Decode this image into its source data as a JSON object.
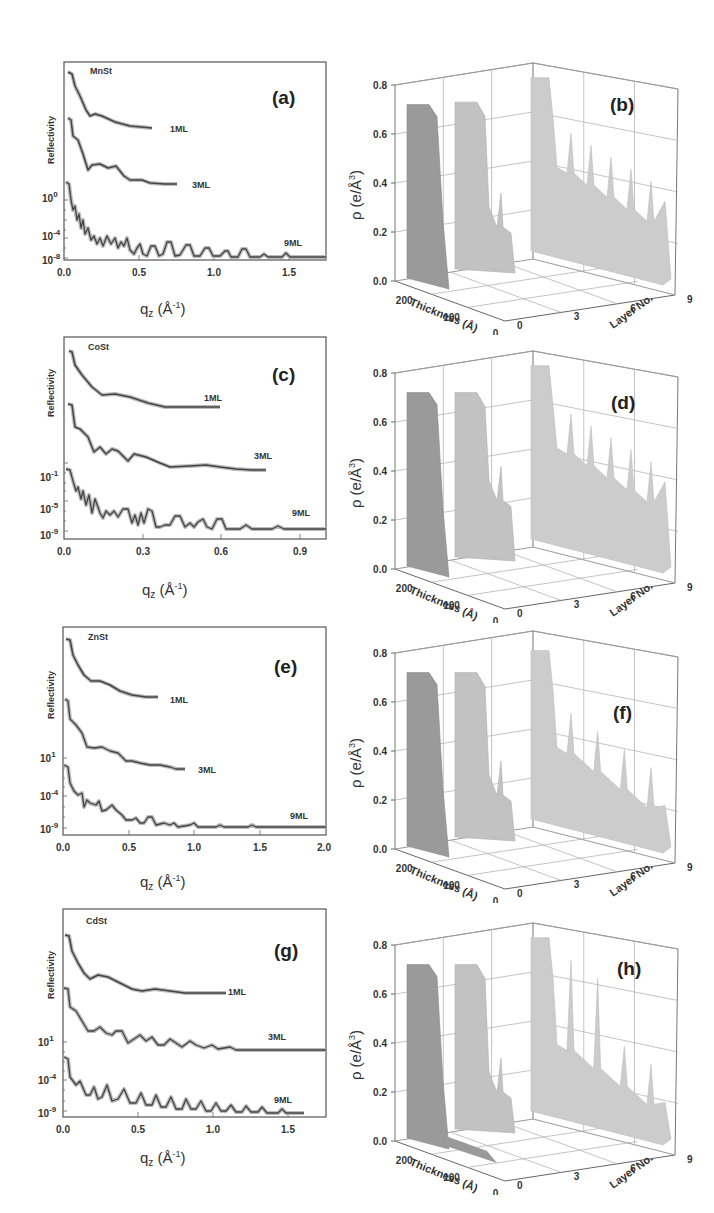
{
  "figure": {
    "left_column": "X-ray reflectivity curves (log scale) with fits for 1ML, 3ML, 9ML films",
    "right_column": "3D electron density profiles vs thickness and layer number"
  },
  "chart_data": [
    {
      "id": "a",
      "type": "line",
      "panel_label": "(a)",
      "material": "MnSt",
      "ylabel": "Reflectivity",
      "xlabel": "q_z (Å⁻¹)",
      "xlim": [
        0.0,
        1.75
      ],
      "xticks": [
        "0.0",
        "0.5",
        "1.0",
        "1.5"
      ],
      "yticks": [
        "10^0",
        "10^-4",
        "10^-8"
      ],
      "series": [
        {
          "name": "1ML",
          "x_end": 0.6
        },
        {
          "name": "3ML",
          "x_end": 0.9
        },
        {
          "name": "9ML",
          "x_end": 1.75
        }
      ]
    },
    {
      "id": "b",
      "type": "area3d",
      "panel_label": "(b)",
      "zlabel": "ρ (e/Å³)",
      "xlabel": "Thickness (Å)",
      "ylabel": "Layer No.",
      "zticks": [
        "0.0",
        "0.2",
        "0.4",
        "0.6",
        "0.8"
      ],
      "xticks": [
        "200",
        "100",
        "0"
      ],
      "yticks": [
        "0",
        "3",
        "6",
        "9"
      ],
      "series": [
        {
          "name": "1ML",
          "plateau": 0.72
        },
        {
          "name": "3ML",
          "plateau": 0.73,
          "tail": 0.22,
          "spikes": 1
        },
        {
          "name": "9ML",
          "plateau": 0.74,
          "tail": 0.35,
          "spikes": 5
        }
      ]
    },
    {
      "id": "c",
      "type": "line",
      "panel_label": "(c)",
      "material": "CoSt",
      "ylabel": "Reflectivity",
      "xlabel": "q_z (Å⁻¹)",
      "xlim": [
        0.0,
        1.0
      ],
      "xticks": [
        "0.0",
        "0.3",
        "0.6",
        "0.9"
      ],
      "yticks": [
        "10^-1",
        "10^-5",
        "10^-9"
      ],
      "series": [
        {
          "name": "1ML",
          "x_end": 0.66
        },
        {
          "name": "3ML",
          "x_end": 0.91
        },
        {
          "name": "9ML",
          "x_end": 1.0
        }
      ]
    },
    {
      "id": "d",
      "type": "area3d",
      "panel_label": "(d)",
      "zlabel": "ρ (e/Å³)",
      "xlabel": "Thickness (Å)",
      "ylabel": "Layer No.",
      "zticks": [
        "0.0",
        "0.2",
        "0.4",
        "0.6",
        "0.8"
      ],
      "xticks": [
        "200",
        "100",
        "0"
      ],
      "yticks": [
        "0",
        "3",
        "6",
        "9"
      ],
      "series": [
        {
          "name": "1ML",
          "plateau": 0.72
        },
        {
          "name": "3ML",
          "plateau": 0.72,
          "tail": 0.28,
          "spikes": 1
        },
        {
          "name": "9ML",
          "plateau": 0.74,
          "tail": 0.38,
          "spikes": 5
        }
      ]
    },
    {
      "id": "e",
      "type": "line",
      "panel_label": "(e)",
      "material": "ZnSt",
      "ylabel": "Reflectivity",
      "xlabel": "q_z (Å⁻¹)",
      "xlim": [
        0.0,
        2.0
      ],
      "xticks": [
        "0.0",
        "0.5",
        "1.0",
        "1.5",
        "2.0"
      ],
      "yticks": [
        "10^1",
        "10^-4",
        "10^-9"
      ],
      "series": [
        {
          "name": "1ML",
          "x_end": 0.72
        },
        {
          "name": "3ML",
          "x_end": 1.0
        },
        {
          "name": "9ML",
          "x_end": 2.0
        }
      ]
    },
    {
      "id": "f",
      "type": "area3d",
      "panel_label": "(f)",
      "zlabel": "ρ (e/Å³)",
      "xlabel": "Thickness (Å)",
      "ylabel": "Layer No.",
      "zticks": [
        "0.0",
        "0.2",
        "0.4",
        "0.6",
        "0.8"
      ],
      "xticks": [
        "200",
        "100",
        "0"
      ],
      "yticks": [
        "0",
        "3",
        "6",
        "9"
      ],
      "series": [
        {
          "name": "1ML",
          "plateau": 0.72
        },
        {
          "name": "3ML",
          "plateau": 0.72,
          "tail": 0.22,
          "spikes": 1
        },
        {
          "name": "9ML",
          "plateau": 0.72,
          "tail": 0.3,
          "spikes": 4
        }
      ]
    },
    {
      "id": "g",
      "type": "line",
      "panel_label": "(g)",
      "material": "CdSt",
      "ylabel": "Reflectivity",
      "xlabel": "q_z (Å⁻¹)",
      "xlim": [
        0.0,
        1.75
      ],
      "xticks": [
        "0.0",
        "0.5",
        "1.0",
        "1.5"
      ],
      "yticks": [
        "10^1",
        "10^-4",
        "10^-9"
      ],
      "series": [
        {
          "name": "1ML",
          "x_end": 1.08
        },
        {
          "name": "3ML",
          "x_end": 1.75
        },
        {
          "name": "9ML",
          "x_end": 1.7
        }
      ]
    },
    {
      "id": "h",
      "type": "area3d",
      "panel_label": "(h)",
      "zlabel": "ρ (e/Å³)",
      "xlabel": "Thickness (Å)",
      "ylabel": "Layer No.",
      "zticks": [
        "0.0",
        "0.2",
        "0.4",
        "0.6",
        "0.8"
      ],
      "xticks": [
        "200",
        "100",
        "0"
      ],
      "yticks": [
        "0",
        "3",
        "6",
        "9"
      ],
      "series": [
        {
          "name": "1ML",
          "plateau": 0.72
        },
        {
          "name": "3ML",
          "plateau": 0.72,
          "tail": 0.2,
          "spikes": 1
        },
        {
          "name": "9ML",
          "plateau": 0.74,
          "tail": 0.28,
          "spikes": 4
        }
      ]
    }
  ],
  "labels": {
    "reflectivity": "Reflectivity",
    "qz": "q",
    "qz_sub": "z",
    "qz_unit": "(Å",
    "qz_exp": "-1",
    "qz_close": ")",
    "rho": "ρ (e/Å",
    "rho_exp": "3",
    "rho_close": ")",
    "thickness": "Thickness (Å)",
    "layer_no": "Layer No.",
    "ml1": "1ML",
    "ml3": "3ML",
    "ml9": "9ML"
  },
  "panels_left": [
    {
      "label": "(a)",
      "material": "MnSt",
      "x_ticks": [
        "0.0",
        "0.5",
        "1.0",
        "1.5"
      ],
      "y_ticks": [
        {
          "base": "10",
          "exp": "0"
        },
        {
          "base": "10",
          "exp": "-4"
        },
        {
          "base": "10",
          "exp": "-8"
        }
      ]
    },
    {
      "label": "(c)",
      "material": "CoSt",
      "x_ticks": [
        "0.0",
        "0.3",
        "0.6",
        "0.9"
      ],
      "y_ticks": [
        {
          "base": "10",
          "exp": "-1"
        },
        {
          "base": "10",
          "exp": "-5"
        },
        {
          "base": "10",
          "exp": "-9"
        }
      ]
    },
    {
      "label": "(e)",
      "material": "ZnSt",
      "x_ticks": [
        "0.0",
        "0.5",
        "1.0",
        "1.5",
        "2.0"
      ],
      "y_ticks": [
        {
          "base": "10",
          "exp": "1"
        },
        {
          "base": "10",
          "exp": "-4"
        },
        {
          "base": "10",
          "exp": "-9"
        }
      ]
    },
    {
      "label": "(g)",
      "material": "CdSt",
      "x_ticks": [
        "0.0",
        "0.5",
        "1.0",
        "1.5"
      ],
      "y_ticks": [
        {
          "base": "10",
          "exp": "1"
        },
        {
          "base": "10",
          "exp": "-4"
        },
        {
          "base": "10",
          "exp": "-9"
        }
      ]
    }
  ],
  "panels_right": [
    {
      "label": "(b)",
      "z_ticks": [
        "0.0",
        "0.2",
        "0.4",
        "0.6",
        "0.8"
      ],
      "x_ticks": [
        "200",
        "100",
        "0"
      ],
      "y_ticks": [
        "0",
        "3",
        "6",
        "9"
      ]
    },
    {
      "label": "(d)",
      "z_ticks": [
        "0.0",
        "0.2",
        "0.4",
        "0.6",
        "0.8"
      ],
      "x_ticks": [
        "200",
        "100",
        "0"
      ],
      "y_ticks": [
        "0",
        "3",
        "6",
        "9"
      ]
    },
    {
      "label": "(f)",
      "z_ticks": [
        "0.0",
        "0.2",
        "0.4",
        "0.6",
        "0.8"
      ],
      "x_ticks": [
        "200",
        "100",
        "0"
      ],
      "y_ticks": [
        "0",
        "3",
        "6",
        "9"
      ]
    },
    {
      "label": "(h)",
      "z_ticks": [
        "0.0",
        "0.2",
        "0.4",
        "0.6",
        "0.8"
      ],
      "x_ticks": [
        "200",
        "100",
        "0"
      ],
      "y_ticks": [
        "0",
        "3",
        "6",
        "9"
      ]
    }
  ]
}
